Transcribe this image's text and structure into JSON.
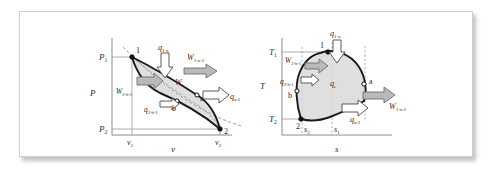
{
  "figure": {
    "type": "thermodynamic-cycle-diagrams",
    "panels": [
      {
        "id": "pv",
        "name": "pressure-volume-diagram",
        "y_axis_label": "P",
        "x_axis_label": "v",
        "y_ticks": [
          "P",
          "P"
        ],
        "y_tick_subs": [
          "1",
          "2"
        ],
        "x_ticks": [
          "v",
          "v"
        ],
        "x_tick_subs": [
          "1",
          "2"
        ],
        "state_points": [
          "1",
          "a",
          "b",
          "2"
        ],
        "annotations": [
          {
            "base": "q",
            "sub": "1-a",
            "kind": "heat-in-arrow"
          },
          {
            "base": "W",
            "sub": "1-a-2",
            "kind": "work-out-arrow"
          },
          {
            "base": "W",
            "sub": "e",
            "kind": "net-work-label"
          },
          {
            "base": "q",
            "sub": "a-2",
            "kind": "heat-out-arrow"
          },
          {
            "base": "W",
            "sub": "2-b-1",
            "kind": "work-in-arrow"
          },
          {
            "base": "q",
            "sub": "2-b-1",
            "kind": "heat-label"
          }
        ]
      },
      {
        "id": "ts",
        "name": "temperature-entropy-diagram",
        "y_axis_label": "T",
        "x_axis_label": "s",
        "y_ticks": [
          "T",
          "T"
        ],
        "y_tick_subs": [
          "1",
          "2"
        ],
        "x_ticks": [
          "s",
          "s"
        ],
        "x_tick_subs": [
          "2",
          "1"
        ],
        "state_points": [
          "1",
          "a",
          "b",
          "2"
        ],
        "annotations": [
          {
            "base": "q",
            "sub": "1-a",
            "kind": "heat-in-arrow"
          },
          {
            "base": "W",
            "sub": "2-b-1",
            "kind": "work-in-arrow"
          },
          {
            "base": "q",
            "sub": "2-b-1",
            "kind": "heat-label"
          },
          {
            "base": "q",
            "sub": "e",
            "kind": "net-heat-label"
          },
          {
            "base": "q",
            "sub": "a-2",
            "kind": "heat-out-arrow"
          },
          {
            "base": "W",
            "sub": "1-a-2",
            "kind": "work-out-arrow"
          }
        ]
      }
    ],
    "colors": {
      "cycle_line": "#1a1a1a",
      "area_fill": "#d9d9d9",
      "axis": "#8a8a8a",
      "arrow_gray": "#b9b9b9",
      "arrow_white": "#ffffff",
      "frame_border": "#cfcfcf"
    }
  }
}
